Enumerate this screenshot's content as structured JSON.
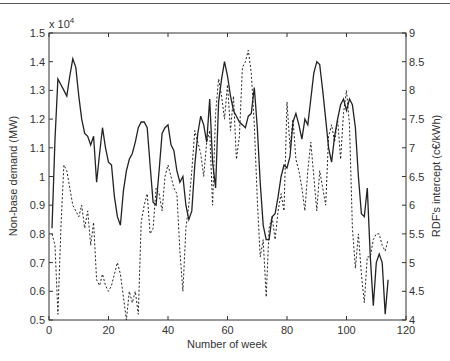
{
  "chart_data": {
    "type": "line",
    "title": "",
    "xlabel": "Number of week",
    "ylabel": "Non-base demand (MW)",
    "ylabel_right": "RDF's intercept (c€/kWh)",
    "y_multiplier": "x 10^4",
    "xlim": [
      0,
      120
    ],
    "ylim": [
      0.5,
      1.5
    ],
    "ylim_right": [
      4,
      9
    ],
    "xticks": [
      0,
      20,
      40,
      60,
      80,
      100,
      120
    ],
    "yticks": [
      0.5,
      0.6,
      0.7,
      0.8,
      0.9,
      1.0,
      1.1,
      1.2,
      1.3,
      1.4,
      1.5
    ],
    "yticks_right": [
      4,
      4.5,
      5,
      5.5,
      6,
      6.5,
      7,
      7.5,
      8,
      8.5,
      9
    ],
    "grid": false,
    "legend": "none",
    "series": [
      {
        "name": "Non-base demand",
        "axis": "left",
        "style": "solid",
        "x": [
          1,
          2,
          3,
          4,
          5,
          6,
          7,
          8,
          9,
          10,
          11,
          12,
          13,
          14,
          15,
          16,
          17,
          18,
          19,
          20,
          21,
          22,
          23,
          24,
          25,
          26,
          27,
          28,
          29,
          30,
          31,
          32,
          33,
          34,
          35,
          36,
          37,
          38,
          39,
          40,
          41,
          42,
          43,
          44,
          45,
          46,
          47,
          48,
          49,
          50,
          51,
          52,
          53,
          54,
          55,
          56,
          57,
          58,
          59,
          60,
          61,
          62,
          63,
          64,
          65,
          66,
          67,
          68,
          69,
          70,
          71,
          72,
          73,
          74,
          75,
          76,
          77,
          78,
          79,
          80,
          81,
          82,
          83,
          84,
          85,
          86,
          87,
          88,
          89,
          90,
          91,
          92,
          93,
          94,
          95,
          96,
          97,
          98,
          99,
          100,
          101,
          102,
          103,
          104,
          105,
          106,
          107,
          108,
          109,
          110,
          111,
          112,
          113,
          114
        ],
        "values": [
          0.82,
          1.13,
          1.34,
          1.32,
          1.3,
          1.28,
          1.35,
          1.41,
          1.38,
          1.28,
          1.2,
          1.15,
          1.14,
          1.11,
          1.14,
          0.98,
          1.08,
          1.17,
          1.1,
          1.05,
          1.04,
          0.93,
          0.86,
          0.83,
          0.95,
          1.02,
          1.06,
          1.08,
          1.12,
          1.17,
          1.19,
          1.19,
          1.17,
          1.04,
          0.91,
          0.9,
          1.02,
          1.15,
          1.17,
          1.18,
          1.11,
          1.09,
          1.02,
          0.98,
          1.0,
          0.9,
          0.85,
          0.88,
          1.04,
          1.15,
          1.21,
          1.18,
          1.12,
          1.27,
          1.05,
          0.96,
          1.26,
          1.34,
          1.4,
          1.35,
          1.28,
          1.23,
          1.21,
          1.19,
          1.18,
          1.17,
          1.21,
          1.22,
          1.31,
          1.17,
          0.98,
          0.83,
          0.78,
          0.78,
          0.86,
          0.87,
          0.93,
          1.0,
          1.04,
          1.03,
          1.07,
          1.19,
          1.22,
          1.18,
          1.13,
          1.2,
          1.18,
          1.27,
          1.36,
          1.4,
          1.39,
          1.3,
          1.2,
          1.1,
          1.05,
          1.14,
          1.2,
          1.25,
          1.27,
          1.23,
          1.27,
          1.25,
          1.17,
          1.0,
          0.87,
          0.86,
          0.96,
          0.72,
          0.55,
          0.7,
          0.73,
          0.7,
          0.52,
          0.64
        ],
        "values_unit_note": "left axis values are in units of 10^4 MW"
      },
      {
        "name": "RDF's intercept",
        "axis": "right",
        "style": "dashed",
        "x": [
          1,
          2,
          3,
          4,
          5,
          6,
          7,
          8,
          9,
          10,
          11,
          12,
          13,
          14,
          15,
          16,
          17,
          18,
          19,
          20,
          21,
          22,
          23,
          24,
          25,
          26,
          27,
          28,
          29,
          30,
          31,
          32,
          33,
          34,
          35,
          36,
          37,
          38,
          39,
          40,
          41,
          42,
          43,
          44,
          45,
          46,
          47,
          48,
          49,
          50,
          51,
          52,
          53,
          54,
          55,
          56,
          57,
          58,
          59,
          60,
          61,
          62,
          63,
          64,
          65,
          66,
          67,
          68,
          69,
          70,
          71,
          72,
          73,
          74,
          75,
          76,
          77,
          78,
          79,
          80,
          81,
          82,
          83,
          84,
          85,
          86,
          87,
          88,
          89,
          90,
          91,
          92,
          93,
          94,
          95,
          96,
          97,
          98,
          99,
          100,
          101,
          102,
          103,
          104,
          105,
          106,
          107,
          108,
          109,
          110,
          111,
          112,
          113,
          114
        ],
        "values": [
          5.5,
          5.3,
          4.1,
          5.6,
          6.7,
          6.6,
          6.3,
          6.0,
          5.9,
          5.8,
          6.0,
          5.6,
          5.9,
          5.3,
          5.7,
          4.7,
          4.6,
          4.8,
          4.6,
          4.5,
          4.6,
          4.8,
          5.0,
          4.8,
          4.4,
          4.0,
          4.5,
          4.3,
          4.5,
          4.1,
          5.7,
          6.0,
          6.2,
          5.5,
          5.6,
          6.3,
          6.2,
          5.9,
          6.5,
          6.7,
          6.5,
          6.3,
          6.2,
          5.2,
          4.5,
          5.6,
          6.0,
          6.6,
          7.3,
          7.1,
          6.9,
          6.5,
          7.1,
          7.3,
          6.0,
          7.6,
          8.2,
          7.9,
          7.5,
          8.1,
          7.3,
          7.9,
          6.8,
          7.2,
          8.4,
          8.5,
          8.7,
          8.3,
          7.4,
          6.1,
          5.1,
          5.4,
          4.4,
          5.6,
          5.8,
          5.4,
          5.9,
          6.2,
          5.9,
          7.8,
          7.0,
          7.5,
          6.8,
          6.6,
          6.3,
          5.9,
          6.6,
          7.1,
          6.5,
          5.9,
          6.6,
          6.3,
          6.0,
          7.2,
          7.4,
          7.1,
          7.5,
          6.8,
          7.6,
          8.0,
          7.4,
          5.6,
          4.9,
          5.5,
          4.8,
          4.3,
          5.1,
          5.1,
          5.4,
          5.5,
          5.5,
          5.3,
          5.2,
          5.4
        ]
      }
    ]
  }
}
